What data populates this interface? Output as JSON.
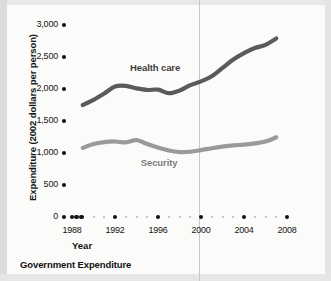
{
  "caption": "Government Expenditure",
  "colors": {
    "health_care": "#5a5a5a",
    "security": "#9a9a9a",
    "axis_text": "#151515",
    "background": "#fbfbfa"
  },
  "chart_data": {
    "type": "line",
    "title": "Government Expenditure",
    "xlabel": "Year",
    "ylabel": "Expenditure (2002 dollars per person)",
    "xlim": [
      1988,
      2008
    ],
    "ylim": [
      0,
      3000
    ],
    "grid": false,
    "legend_position": "inline-annotation",
    "x_ticks": [
      1988,
      1992,
      1996,
      2000,
      2004,
      2008
    ],
    "x_tick_labels": [
      "1988",
      "1992",
      "1996",
      "2000",
      "2004",
      "2008"
    ],
    "y_ticks": [
      0,
      500,
      1000,
      1500,
      2000,
      2500,
      3000
    ],
    "y_tick_labels": [
      "0",
      "500",
      "1,000",
      "1,500",
      "2,000",
      "2,500",
      "3,000"
    ],
    "x": [
      1989,
      1990,
      1991,
      1992,
      1993,
      1994,
      1995,
      1996,
      1997,
      1998,
      1999,
      2000,
      2001,
      2002,
      2003,
      2004,
      2005,
      2006,
      2007
    ],
    "series": [
      {
        "name": "Health care",
        "color": "#5a5a5a",
        "values": [
          1750,
          1830,
          1930,
          2040,
          2050,
          2010,
          1985,
          1990,
          1935,
          1975,
          2060,
          2120,
          2200,
          2330,
          2460,
          2560,
          2640,
          2690,
          2790
        ]
      },
      {
        "name": "Security",
        "color": "#9a9a9a",
        "values": [
          1080,
          1140,
          1170,
          1180,
          1165,
          1200,
          1140,
          1085,
          1040,
          1015,
          1020,
          1045,
          1075,
          1100,
          1120,
          1130,
          1150,
          1180,
          1245
        ]
      }
    ],
    "annotations": [
      {
        "text": "Health care",
        "x": 1996,
        "y": 2330
      },
      {
        "text": "Security",
        "x": 1997,
        "y": 840
      }
    ]
  }
}
